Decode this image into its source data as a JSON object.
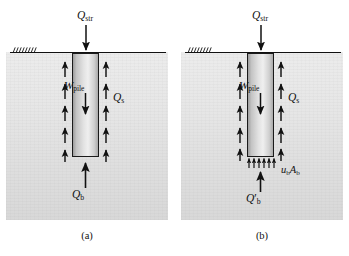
{
  "figure": {
    "panels": [
      {
        "id": "a",
        "caption": "(a)",
        "labels": {
          "structural_load": "Q",
          "structural_load_sub": "str",
          "pile_weight": "W",
          "pile_weight_sub": "pile",
          "shaft_resistance": "Q",
          "shaft_resistance_sub": "s",
          "base_resistance": "Q",
          "base_resistance_sub": "b",
          "base_prime": ""
        }
      },
      {
        "id": "b",
        "caption": "(b)",
        "labels": {
          "structural_load": "Q",
          "structural_load_sub": "str",
          "pile_weight": "W",
          "pile_weight_sub": "pile",
          "shaft_resistance": "Q",
          "shaft_resistance_sub": "s",
          "base_resistance": "Q",
          "base_resistance_sub": "b",
          "base_prime": "′",
          "pore_pressure": "u",
          "pore_pressure_sub": "b",
          "pore_area": "A",
          "pore_area_sub": "b"
        }
      }
    ],
    "colors": {
      "ink": "#111111",
      "soil_light": "#ececec",
      "soil_dark": "#d8d8d8",
      "pile_light": "#efefef",
      "pile_dark": "#9d9d9d",
      "background": "#ffffff"
    },
    "geometry": {
      "shaft_arrow_count_per_side": 5,
      "base_arrow_count_panel_b": 6,
      "ground_line_label": "ground-surface"
    }
  }
}
